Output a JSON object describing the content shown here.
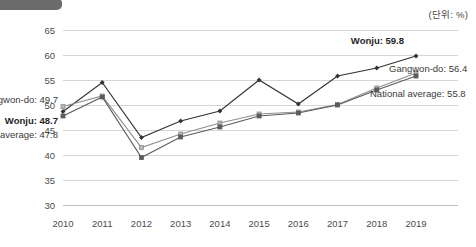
{
  "unit_note": "(단위: %)",
  "chart_data": {
    "type": "line",
    "title": "",
    "xlabel": "",
    "ylabel": "",
    "unit": "%",
    "grid": true,
    "legend_position": "inline-endpoint-labels",
    "ylim": [
      30,
      65
    ],
    "yticks": [
      30,
      35,
      40,
      45,
      50,
      55,
      60,
      65
    ],
    "categories": [
      "2010",
      "2011",
      "2012",
      "2013",
      "2014",
      "2015",
      "2016",
      "2017",
      "2018",
      "2019"
    ],
    "series": [
      {
        "name": "Wonju",
        "color": "#333333",
        "start_label": "Wonju: 48.7",
        "end_label": "Wonju: 59.8",
        "values": [
          48.7,
          54.5,
          43.5,
          46.8,
          48.8,
          55.0,
          50.2,
          55.8,
          57.4,
          59.8
        ]
      },
      {
        "name": "Gangwon-do",
        "color": "#8f8f8f",
        "start_label": "Gangwon-do: 49.7",
        "end_label": "Gangwon-do: 56.4",
        "values": [
          49.7,
          51.8,
          41.5,
          44.2,
          46.4,
          48.2,
          48.6,
          50.1,
          53.4,
          56.4
        ]
      },
      {
        "name": "National average",
        "color": "#5c5c5c",
        "start_label": "National average: 47.8",
        "end_label": "National average: 55.8",
        "values": [
          47.8,
          51.6,
          39.5,
          43.6,
          45.6,
          47.8,
          48.4,
          50.0,
          53.0,
          55.8
        ]
      }
    ]
  }
}
